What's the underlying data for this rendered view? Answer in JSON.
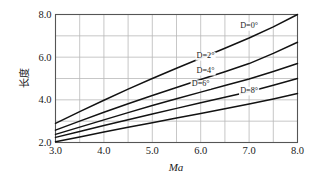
{
  "chart_data": {
    "type": "line",
    "title": "",
    "xlabel": "Ma",
    "ylabel": "长度",
    "xlim": [
      3.0,
      8.0
    ],
    "ylim": [
      2.0,
      8.0
    ],
    "grid": true,
    "legend_position": "inline-curve-labels",
    "x_ticks": [
      "3.0",
      "4.0",
      "5.0",
      "6.0",
      "7.0",
      "8.0"
    ],
    "x_tick_values": [
      3.0,
      4.0,
      5.0,
      6.0,
      7.0,
      8.0
    ],
    "x_gridline_values": [
      3.0,
      3.5,
      4.0,
      4.5,
      5.0,
      5.5,
      6.0,
      6.5,
      7.0,
      7.5,
      8.0
    ],
    "y_ticks": [
      "2.0",
      "4.0",
      "6.0",
      "8.0"
    ],
    "y_tick_values": [
      2.0,
      4.0,
      6.0,
      8.0
    ],
    "y_gridline_values": [
      2.0,
      3.0,
      4.0,
      5.0,
      6.0,
      7.0,
      8.0
    ],
    "x": [
      3.0,
      3.5,
      4.0,
      4.5,
      5.0,
      5.5,
      6.0,
      6.5,
      7.0,
      7.5,
      8.0
    ],
    "series": [
      {
        "name": "D=0°",
        "label": "D=0°",
        "color": "#121212",
        "label_x": 7.0,
        "label_y": 7.35,
        "values": [
          2.9,
          3.45,
          3.98,
          4.5,
          5.0,
          5.48,
          5.95,
          6.42,
          6.9,
          7.42,
          8.0
        ]
      },
      {
        "name": "D=2°",
        "label": "D=2°",
        "color": "#121212",
        "label_x": 6.1,
        "label_y": 5.95,
        "values": [
          2.58,
          3.0,
          3.42,
          3.82,
          4.2,
          4.58,
          4.95,
          5.32,
          5.7,
          6.18,
          6.7
        ]
      },
      {
        "name": "D=4°",
        "label": "D=4°",
        "color": "#121212",
        "label_x": 6.1,
        "label_y": 5.25,
        "values": [
          2.38,
          2.72,
          3.06,
          3.4,
          3.73,
          4.05,
          4.36,
          4.67,
          4.98,
          5.33,
          5.7
        ]
      },
      {
        "name": "D=6°",
        "label": "D=6°",
        "color": "#121212",
        "label_x": 6.0,
        "label_y": 4.63,
        "values": [
          2.24,
          2.52,
          2.8,
          3.07,
          3.34,
          3.6,
          3.86,
          4.12,
          4.38,
          4.68,
          5.0
        ]
      },
      {
        "name": "D=8°",
        "label": "D=8°",
        "color": "#121212",
        "label_x": 7.0,
        "label_y": 4.32,
        "values": [
          2.04,
          2.26,
          2.49,
          2.71,
          2.93,
          3.15,
          3.36,
          3.58,
          3.8,
          4.04,
          4.3
        ]
      }
    ]
  },
  "axes": {
    "x_label": "Ma",
    "y_label": "长度"
  }
}
